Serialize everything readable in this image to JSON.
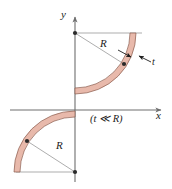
{
  "figure": {
    "type": "technical-diagram",
    "axes": {
      "x_label": "x",
      "y_label": "y",
      "origin_x": 75,
      "origin_y": 110
    },
    "labels": {
      "radius_top": "R",
      "radius_bottom": "R",
      "thickness": "t",
      "condition": "(t ≪ R)"
    },
    "colors": {
      "band_fill": "#e8b9ab",
      "band_edge": "#8a5c4e",
      "axis": "#6e6e6e",
      "dimension_line": "#7a7a7a",
      "text": "#1c1c1c",
      "marker": "#2a2a2a",
      "background": "#ffffff"
    },
    "geometry": {
      "radius_px": 58,
      "thickness_px": 6,
      "upper_center_x": 75,
      "upper_center_y": 33,
      "lower_center_x": 75,
      "lower_center_y": 172
    }
  }
}
